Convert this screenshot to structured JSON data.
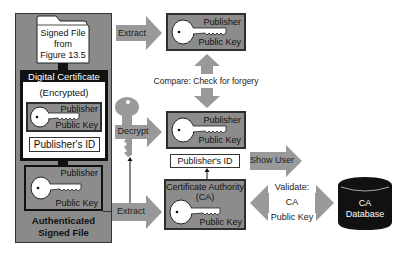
{
  "figure": {
    "left_panel": {
      "signed_file_label": [
        "Signed File",
        "from",
        "Figure 13.5"
      ],
      "digital_certificate": {
        "header": "Digital Certificate",
        "subheader": "(Encrypted)",
        "key": {
          "top": "Publisher",
          "bottom": "Public Key"
        },
        "id_label": "Publisher's ID"
      },
      "lower_key": {
        "top": "Publisher",
        "bottom": "Public Key"
      },
      "footer": [
        "Authenticated",
        "Signed File"
      ]
    },
    "arrows": {
      "extract_top": "Extract",
      "decrypt": "Decrypt",
      "extract_bottom": "Extract",
      "compare": "Compare: Check for forgery",
      "show_user": "Show User",
      "validate": [
        "Validate:",
        "CA",
        "Public Key"
      ]
    },
    "top_key": {
      "top": "Publisher",
      "bottom": "Public Key"
    },
    "middle_key": {
      "top": "Publisher",
      "bottom": "Public Key"
    },
    "middle_id": "Publisher's ID",
    "ca_box": {
      "title": [
        "Certificate Authority",
        "(CA)"
      ],
      "bottom": "Public Key"
    },
    "database": [
      "CA",
      "Database"
    ],
    "colors": {
      "box_gray": "#8c8c8c",
      "arrow_gray": "#999999",
      "dark": "#111111",
      "border": "#2e2e2e"
    }
  }
}
